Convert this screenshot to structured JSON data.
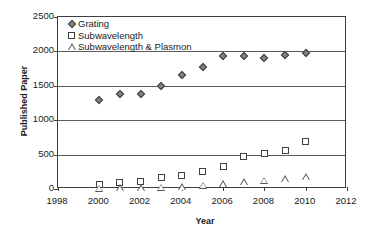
{
  "chart_data": {
    "type": "scatter",
    "title": "",
    "xlabel": "Year",
    "ylabel": "Published Paper",
    "xlim": [
      1998,
      2012
    ],
    "ylim": [
      0,
      2500
    ],
    "xticks": [
      1998,
      2000,
      2002,
      2004,
      2006,
      2008,
      2010,
      2012
    ],
    "yticks": [
      0,
      500,
      1000,
      1500,
      2000,
      2500
    ],
    "grid": "horizontal",
    "legend_position": "top-left",
    "x": [
      2000,
      2001,
      2002,
      2003,
      2004,
      2005,
      2006,
      2007,
      2008,
      2009,
      2010
    ],
    "series": [
      {
        "name": "Grating",
        "marker": "filled-diamond",
        "color": "#808080",
        "values": [
          1290,
          1380,
          1375,
          1500,
          1660,
          1770,
          1940,
          1930,
          1910,
          1950,
          1980
        ]
      },
      {
        "name": "Subwavelength",
        "marker": "open-square",
        "color": "#ffffff",
        "values": [
          70,
          95,
          110,
          160,
          190,
          260,
          330,
          470,
          520,
          560,
          690
        ]
      },
      {
        "name": "Subwavelength & Plasmon",
        "marker": "open-triangle",
        "color": "#ffffff",
        "values": [
          10,
          15,
          20,
          25,
          35,
          55,
          75,
          110,
          130,
          150,
          175
        ]
      }
    ]
  },
  "legend": {
    "items": [
      {
        "label": "Grating",
        "marker": "filled-diamond-icon"
      },
      {
        "label": "Subwavelength",
        "marker": "open-square-icon"
      },
      {
        "label": "Subwavelength & Plasmon",
        "marker": "open-triangle-icon"
      }
    ]
  },
  "axes": {
    "y_title": "Published Paper",
    "x_title": "Year",
    "y_tick_labels": [
      "0",
      "500",
      "1000",
      "1500",
      "2000",
      "2500"
    ],
    "x_tick_labels": [
      "1998",
      "2000",
      "2002",
      "2004",
      "2006",
      "2008",
      "2010",
      "2012"
    ]
  },
  "colors": {
    "axis": "#3f3f3f",
    "gridline": "#5a5a5a",
    "marker_fill": "#808080",
    "marker_edge": "#404040",
    "text": "#1a1a1a",
    "background": "#ffffff"
  }
}
